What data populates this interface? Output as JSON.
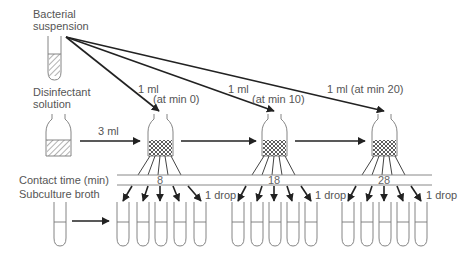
{
  "labels": {
    "bacterial_suspension_line1": "Bacterial",
    "bacterial_suspension_line2": "suspension",
    "disinfectant_line1": "Disinfectant",
    "disinfectant_line2": "solution",
    "volume_disinfectant": "3 ml",
    "contact_time": "Contact time (min)",
    "subculture_broth": "Subculture broth"
  },
  "transfers": [
    {
      "volume": "1 ml",
      "timing": "(at min 0)"
    },
    {
      "volume": "1 ml",
      "timing": "(at min 10)"
    },
    {
      "volume": "1 ml (at min 20)",
      "timing": ""
    }
  ],
  "contact_times": [
    "8",
    "18",
    "28"
  ],
  "drop_label": "1 drop",
  "colors": {
    "text": "#555555",
    "arrow": "#222222",
    "outline": "#444444",
    "lines": "#888888"
  }
}
